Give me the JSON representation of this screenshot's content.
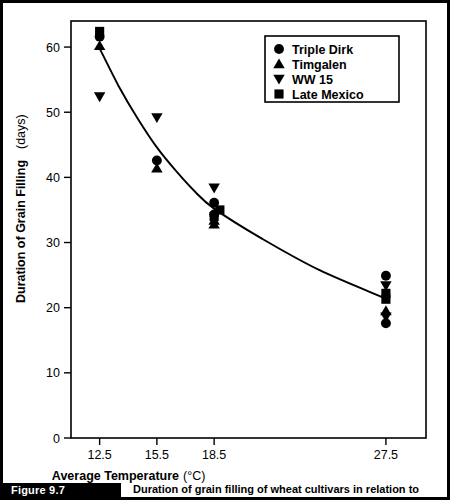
{
  "figure": {
    "number_label": "Figure 9.7",
    "caption": "Duration of grain filling of wheat cultivars in relation to temperature"
  },
  "chart_data": {
    "type": "scatter",
    "title": "",
    "xlabel": "Average Temperature",
    "xlabel_unit": "(°C)",
    "ylabel": "Duration of Grain Filling",
    "ylabel_unit": "(days)",
    "x_tick_labels": [
      "12.5",
      "15.5",
      "18.5",
      "27.5"
    ],
    "x_tick_values": [
      12.5,
      15.5,
      18.5,
      27.5
    ],
    "y_tick_labels": [
      "0",
      "10",
      "20",
      "30",
      "40",
      "50",
      "60"
    ],
    "y_tick_values": [
      0,
      10,
      20,
      30,
      40,
      50,
      60
    ],
    "xlim": [
      11.0,
      29.6
    ],
    "ylim": [
      0,
      64
    ],
    "grid": false,
    "legend_position": "top-right",
    "marker_color": "#000000",
    "line_color": "#000000",
    "series": [
      {
        "name": "Triple Dirk",
        "marker": "circle",
        "points": [
          {
            "x": 12.5,
            "y": 61.6
          },
          {
            "x": 15.5,
            "y": 42.6
          },
          {
            "x": 18.5,
            "y": 36.1
          },
          {
            "x": 18.5,
            "y": 34.3
          },
          {
            "x": 27.5,
            "y": 24.9
          },
          {
            "x": 27.5,
            "y": 17.6
          }
        ]
      },
      {
        "name": "Timgalen",
        "marker": "triangle-up",
        "points": [
          {
            "x": 12.5,
            "y": 60.2
          },
          {
            "x": 15.5,
            "y": 41.4
          },
          {
            "x": 18.5,
            "y": 33.4
          },
          {
            "x": 18.5,
            "y": 32.8
          },
          {
            "x": 27.5,
            "y": 19.5
          }
        ]
      },
      {
        "name": "WW 15",
        "marker": "triangle-down",
        "points": [
          {
            "x": 12.5,
            "y": 52.4
          },
          {
            "x": 15.5,
            "y": 49.2
          },
          {
            "x": 18.5,
            "y": 38.4
          },
          {
            "x": 27.5,
            "y": 23.4
          },
          {
            "x": 27.5,
            "y": 18.6
          }
        ]
      },
      {
        "name": "Late Mexico",
        "marker": "square",
        "points": [
          {
            "x": 12.5,
            "y": 62.4
          },
          {
            "x": 18.8,
            "y": 35.0
          },
          {
            "x": 18.5,
            "y": 34.0
          },
          {
            "x": 27.5,
            "y": 22.2
          },
          {
            "x": 27.5,
            "y": 21.3
          }
        ]
      }
    ],
    "trend_line": {
      "name": "fitted-curve",
      "points": [
        {
          "x": 12.5,
          "y": 59.8
        },
        {
          "x": 13.5,
          "y": 54.0
        },
        {
          "x": 14.5,
          "y": 49.0
        },
        {
          "x": 15.5,
          "y": 44.6
        },
        {
          "x": 16.5,
          "y": 41.0
        },
        {
          "x": 17.5,
          "y": 37.8
        },
        {
          "x": 18.5,
          "y": 35.2
        },
        {
          "x": 21.0,
          "y": 30.6
        },
        {
          "x": 24.0,
          "y": 25.8
        },
        {
          "x": 27.5,
          "y": 21.4
        }
      ]
    },
    "legend_entries": [
      {
        "label": "Triple Dirk",
        "marker": "circle"
      },
      {
        "label": "Timgalen",
        "marker": "triangle-up"
      },
      {
        "label": "WW 15",
        "marker": "triangle-down"
      },
      {
        "label": "Late Mexico",
        "marker": "square"
      }
    ]
  }
}
